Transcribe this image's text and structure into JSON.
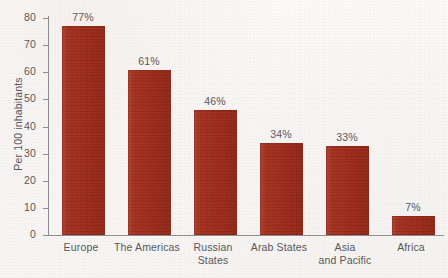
{
  "chart_data": {
    "type": "bar",
    "title": "",
    "subtitle": "",
    "xlabel": "",
    "ylabel": "Per 100 inhabitants",
    "ylim": [
      0,
      80
    ],
    "yticks": [
      0,
      10,
      20,
      30,
      40,
      50,
      60,
      70,
      80
    ],
    "ytick_labels": [
      "0",
      "10",
      "20",
      "30",
      "40",
      "50",
      "60",
      "70",
      "80"
    ],
    "grid": false,
    "legend": false,
    "legend_position": "none",
    "bar_color": "#a02817",
    "text_color": "#54545a",
    "axis_color": "#8e8c8c",
    "background_color": "#fbf9f8",
    "categories": [
      "Europe",
      "The Americas",
      "Russian States",
      "Arab States",
      "Asia and Pacific",
      "Africa"
    ],
    "category_lines": [
      [
        "Europe"
      ],
      [
        "The Americas"
      ],
      [
        "Russian",
        "States"
      ],
      [
        "Arab States"
      ],
      [
        "Asia",
        "and Pacific"
      ],
      [
        "Africa"
      ]
    ],
    "values": [
      77,
      61,
      46,
      34,
      33,
      7
    ],
    "data_labels": [
      "77%",
      "61%",
      "46%",
      "34%",
      "33%",
      "7%"
    ]
  }
}
